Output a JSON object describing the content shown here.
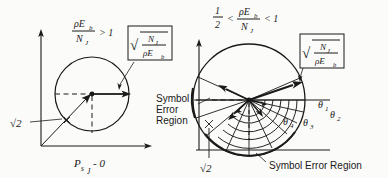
{
  "figure": {
    "background_color": "#fbfbf9",
    "ink_color": "#1a1a1a"
  },
  "left_panel": {
    "condition": {
      "numerator": "ρE",
      "numerator_sub": "b",
      "denominator": "N",
      "denominator_sub": "J",
      "relation": "> 1"
    },
    "radius_label": {
      "radical": "√",
      "numerator": "N",
      "numerator_sub": "J",
      "denominator": "ρE",
      "denominator_sub": "b"
    },
    "diagonal_label": "√2",
    "axis_label": {
      "symbol": "P",
      "sub1": "s",
      "sub2": "J",
      "value": "- 0"
    }
  },
  "right_panel": {
    "condition": {
      "lhs": "1",
      "lhs_den": "2",
      "relation_left": "<",
      "numerator": "ρE",
      "numerator_sub": "b",
      "denominator": "N",
      "denominator_sub": "J",
      "relation_right": "< 1"
    },
    "radius_label": {
      "radical": "√",
      "numerator": "N",
      "numerator_sub": "J",
      "denominator": "ρE",
      "denominator_sub": "b"
    },
    "diagonal_label": "√2",
    "angles": [
      {
        "symbol": "θ",
        "sub": "1"
      },
      {
        "symbol": "θ",
        "sub": "2"
      },
      {
        "symbol": "θ",
        "sub": "3"
      },
      {
        "symbol": "θ",
        "sub": "4"
      }
    ],
    "caption": "Symbol Error Region"
  },
  "center_annotation": {
    "line1": "Symbol",
    "line2": "Error",
    "line3": "Region"
  }
}
